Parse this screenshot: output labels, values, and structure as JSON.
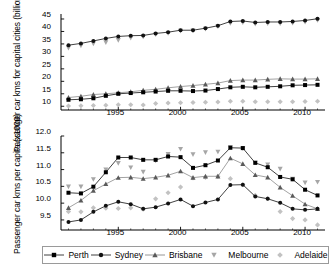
{
  "chart_data": [
    {
      "type": "line",
      "panel": "top",
      "title": "",
      "ylabel": "Passenger car kms for capital cities (billion km)",
      "xlabel": "",
      "ylim": [
        8.5,
        47
      ],
      "yticks": [
        10,
        15,
        20,
        25,
        30,
        35,
        40,
        45
      ],
      "xlim": [
        1990.4,
        2011.6
      ],
      "xticks": [
        1995,
        2000,
        2005,
        2010
      ],
      "x": [
        1991,
        1992,
        1993,
        1994,
        1995,
        1996,
        1997,
        1998,
        1999,
        2000,
        2001,
        2002,
        2003,
        2004,
        2005,
        2006,
        2007,
        2008,
        2009,
        2010,
        2011
      ],
      "grid": false,
      "legend_position": "bottom-shared",
      "series": [
        {
          "name": "Perth",
          "marker": "square",
          "values": [
            12.6,
            12.8,
            13.2,
            14.2,
            15.0,
            15.3,
            15.6,
            15.9,
            16.2,
            16.2,
            16.1,
            16.3,
            16.9,
            17.6,
            17.8,
            17.6,
            17.8,
            18.0,
            18.4,
            18.5,
            18.6
          ]
        },
        {
          "name": "Sydney",
          "marker": "circle",
          "values": [
            34.5,
            35.2,
            36.2,
            37.2,
            38.0,
            38.3,
            38.4,
            39.2,
            39.7,
            40.5,
            40.5,
            41.3,
            42.3,
            44.0,
            44.2,
            43.6,
            43.8,
            43.8,
            44.0,
            44.4,
            45.1
          ]
        },
        {
          "name": "Brisbane",
          "marker": "triangle",
          "values": [
            13.5,
            14.0,
            14.7,
            15.0,
            15.4,
            15.8,
            16.4,
            16.8,
            17.4,
            17.9,
            18.3,
            18.8,
            19.3,
            20.3,
            20.5,
            20.5,
            20.8,
            21.0,
            20.9,
            20.9,
            21.0
          ]
        },
        {
          "name": "Melbourne",
          "marker": "inv-triangle",
          "values": [
            33.4,
            34.3,
            35.1,
            35.6,
            36.5,
            37.4,
            37.9,
            38.8,
            39.3,
            40.2,
            40.3,
            41.0,
            42.0,
            43.3,
            43.6,
            43.0,
            43.2,
            43.2,
            43.4,
            43.8,
            44.5
          ]
        },
        {
          "name": "Adelaide",
          "marker": "diamond",
          "values": [
            10.1,
            10.2,
            10.3,
            10.4,
            10.6,
            10.6,
            10.5,
            11.1,
            11.3,
            11.4,
            11.5,
            11.6,
            11.7,
            12.0,
            12.0,
            11.8,
            11.8,
            11.8,
            11.8,
            11.9,
            12.0
          ]
        }
      ]
    },
    {
      "type": "line",
      "panel": "bottom",
      "title": "",
      "ylabel": "Passenger car kms per capita (x1000)",
      "xlabel": "",
      "ylim": [
        9.2,
        12.0
      ],
      "yticks": [
        9.5,
        10.0,
        10.5,
        11.0,
        11.5,
        12.0
      ],
      "xlim": [
        1990.4,
        2011.6
      ],
      "xticks": [
        1995,
        2000,
        2005,
        2010
      ],
      "x": [
        1991,
        1992,
        1993,
        1994,
        1995,
        1996,
        1997,
        1998,
        1999,
        2000,
        2001,
        2002,
        2003,
        2004,
        2005,
        2006,
        2007,
        2008,
        2009,
        2010,
        2011
      ],
      "grid": false,
      "legend_position": "bottom",
      "series": [
        {
          "name": "Perth",
          "marker": "square",
          "values": [
            10.31,
            10.29,
            10.49,
            10.92,
            11.36,
            11.36,
            11.29,
            11.29,
            11.39,
            11.37,
            11.05,
            11.13,
            11.27,
            11.65,
            11.64,
            11.2,
            11.07,
            10.78,
            10.71,
            10.4,
            10.23
          ]
        },
        {
          "name": "Sydney",
          "marker": "circle",
          "values": [
            9.44,
            9.5,
            9.74,
            9.92,
            10.04,
            9.97,
            9.83,
            9.88,
            9.99,
            10.11,
            9.91,
            10.02,
            10.11,
            10.54,
            10.55,
            10.2,
            10.13,
            10.01,
            9.83,
            9.8,
            9.83
          ]
        },
        {
          "name": "Brisbane",
          "marker": "triangle",
          "values": [
            9.86,
            10.08,
            10.37,
            10.57,
            10.76,
            10.77,
            10.73,
            10.77,
            10.83,
            10.95,
            10.76,
            10.8,
            10.8,
            11.34,
            11.17,
            10.84,
            10.77,
            10.47,
            10.22,
            9.97,
            9.83
          ]
        },
        {
          "name": "Melbourne",
          "marker": "inv-triangle",
          "values": [
            10.49,
            10.49,
            10.71,
            11.0,
            11.19,
            11.06,
            10.93,
            11.26,
            11.46,
            11.61,
            11.45,
            11.51,
            11.53,
            11.67,
            11.63,
            11.21,
            11.15,
            11.02,
            10.72,
            10.61,
            10.63
          ]
        },
        {
          "name": "Adelaide",
          "marker": "diamond",
          "values": [
            9.75,
            9.74,
            9.86,
            9.85,
            9.84,
            9.86,
            9.82,
            10.13,
            10.31,
            10.48,
            10.75,
            10.77,
            10.8,
            10.73,
            10.55,
            10.23,
            10.14,
            9.75,
            9.54,
            9.5,
            9.35
          ]
        }
      ]
    }
  ],
  "legend": {
    "items": [
      {
        "label": "Perth",
        "marker": "square"
      },
      {
        "label": "Sydney",
        "marker": "circle"
      },
      {
        "label": "Brisbane",
        "marker": "triangle"
      },
      {
        "label": "Melbourne",
        "marker": "inv-triangle"
      },
      {
        "label": "Adelaide",
        "marker": "diamond"
      }
    ]
  },
  "colors": {
    "perth": "#000000",
    "sydney": "#111111",
    "brisbane": "#5a5a5a",
    "melbourne": "#a6a6a6",
    "adelaide": "#c2c2c2",
    "axis": "#000000",
    "legend_border": "#9a9a9a"
  }
}
